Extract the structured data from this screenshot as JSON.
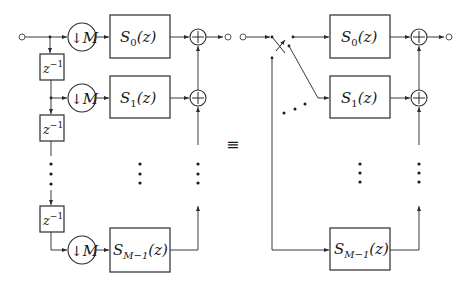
{
  "diagram": {
    "type": "block-diagram",
    "equivalence_symbol": "≡",
    "left": {
      "name": "polyphase decomposition with delay chain",
      "delay_label": "z",
      "delay_exp": "−1",
      "downsampler_arrow": "↓",
      "downsampler_label": "M",
      "adder_symbol": "+",
      "filters": [
        {
          "letter": "S",
          "sub": "0",
          "arg": "(z)",
          "style": "script"
        },
        {
          "letter": "S",
          "sub": "1",
          "arg": "(z)",
          "style": "script"
        },
        {
          "letter": "S",
          "sub": "M−1",
          "arg": "(z)",
          "style": "script"
        }
      ],
      "ellipsis": "⋮"
    },
    "right": {
      "name": "commutator switch implementation",
      "adder_symbol": "+",
      "filters": [
        {
          "letter": "S",
          "sub": "0",
          "arg": "(z)"
        },
        {
          "letter": "S",
          "sub": "1",
          "arg": "(z)"
        },
        {
          "letter": "S",
          "sub": "M−1",
          "arg": "(z)"
        }
      ],
      "ellipsis": "⋮",
      "switch": "commutator"
    }
  }
}
